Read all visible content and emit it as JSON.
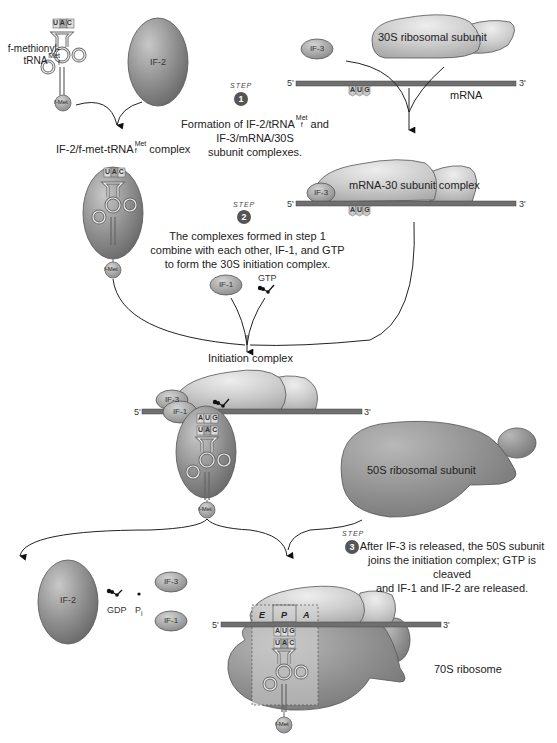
{
  "figure": {
    "step1": {
      "badge": "1",
      "step_word": "STEP",
      "text_line1_pre": "Formation of IF-2/tRNA",
      "text_line1_sup": "Met",
      "text_line1_sub": "f",
      "text_line1_post": " and",
      "text_line2": "IF-3/mRNA/30S",
      "text_line3": "subunit complexes."
    },
    "step2": {
      "badge": "2",
      "step_word": "STEP",
      "text_line1": "The complexes formed in step 1",
      "text_line2": "combine with each other, IF-1, and GTP",
      "text_line3": "to form the 30S initiation complex."
    },
    "step3": {
      "badge": "3",
      "step_word": "STEP",
      "text_line1": "After IF-3 is released, the 50S subunit",
      "text_line2": "joins the initiation complex; GTP is cleaved",
      "text_line3": "and IF-1 and IF-2 are released."
    },
    "labels": {
      "fmet_trna_line1": "f-methionyl-",
      "fmet_trna_line2": "tRNA",
      "met_sup": "Met",
      "f_sub": "f",
      "if2": "IF-2",
      "if3": "IF-3",
      "if1": "IF-1",
      "fmet": "f-Met",
      "ribosome_30s": "30S ribosomal subunit",
      "mrna": "mRNA",
      "five_prime": "5'",
      "three_prime": "3'",
      "if2_complex_pre": "IF-2/f-met-tRNA",
      "if2_complex_post": " complex",
      "mrna_30_complex": "mRNA-30 subunit complex",
      "gtp": "GTP",
      "initiation_complex": "Initiation complex",
      "ribosome_50s": "50S ribosomal subunit",
      "gdp": "GDP",
      "pi": "P",
      "pi_sub": "i",
      "ribosome_70s": "70S ribosome",
      "site_e": "E",
      "site_p": "P",
      "site_a": "A"
    },
    "codons": {
      "start_codon": [
        "A",
        "U",
        "G"
      ],
      "anticodon": [
        "U",
        "A",
        "C"
      ]
    },
    "colors": {
      "ribosome_light": "#c9c9c9",
      "ribosome_dark": "#8f8f8f",
      "factor_fill": "#9a9a9a",
      "if2_fill": "#8a8a8a",
      "mrna": "#6f6f6f",
      "badge": "#555555"
    }
  }
}
